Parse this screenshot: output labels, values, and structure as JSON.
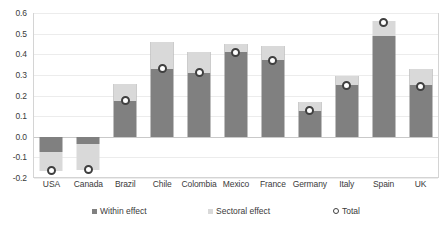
{
  "chart_data": {
    "type": "bar",
    "title": "",
    "subtitle": "",
    "xlabel": "",
    "ylabel": "",
    "ylim": [
      -0.2,
      0.6
    ],
    "yticks": [
      "0.6",
      "0.5",
      "0.4",
      "0.3",
      "0.2",
      "0.1",
      "0.0",
      "-0.1",
      "-0.2"
    ],
    "ytick_values": [
      0.6,
      0.5,
      0.4,
      0.3,
      0.2,
      0.1,
      0.0,
      -0.1,
      -0.2
    ],
    "grid": true,
    "stacked": true,
    "legend_position": "bottom",
    "categories": [
      "USA",
      "Canada",
      "Brazil",
      "Chile",
      "Colombia",
      "Mexico",
      "France",
      "Germany",
      "Italy",
      "Spain",
      "UK"
    ],
    "series": [
      {
        "name": "Within effect",
        "color": "#808080",
        "values": [
          -0.075,
          -0.035,
          0.255,
          0.46,
          0.41,
          0.45,
          0.44,
          0.17,
          0.295,
          0.49,
          0.33
        ]
      },
      {
        "name": "Sectoral effect",
        "color": "#d9d9d9",
        "values": [
          -0.09,
          -0.125,
          -0.08,
          -0.13,
          -0.1,
          -0.04,
          -0.07,
          -0.045,
          -0.045,
          0.07,
          -0.08
        ]
      },
      {
        "name": "Total",
        "color": "#3f3f3f",
        "marker": "circle",
        "values": [
          -0.165,
          -0.16,
          0.175,
          0.33,
          0.31,
          0.41,
          0.37,
          0.125,
          0.25,
          0.555,
          0.245
        ]
      }
    ]
  },
  "legend": {
    "items": [
      {
        "label": "Within effect",
        "swatch": "square-dark"
      },
      {
        "label": "Sectoral effect",
        "swatch": "square-light"
      },
      {
        "label": "Total",
        "swatch": "circle-marker"
      }
    ]
  },
  "colors": {
    "within": "#808080",
    "sectoral": "#d9d9d9",
    "total_ring": "#3f3f3f",
    "grid": "#ececec",
    "zero_line": "#c9c9c9",
    "frame": "#d4d4d4",
    "text": "#3a3a3a",
    "background": "#ffffff"
  }
}
